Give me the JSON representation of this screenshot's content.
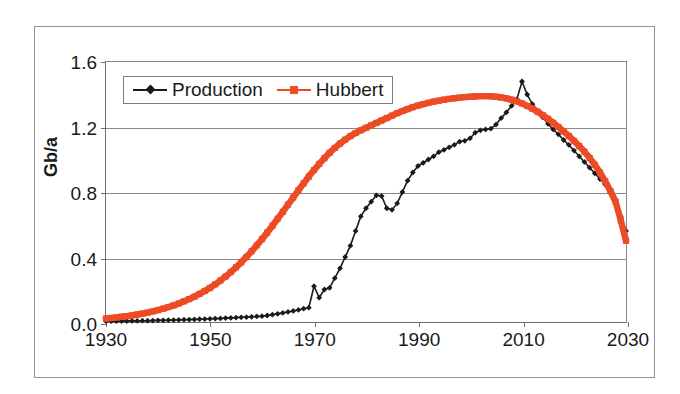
{
  "colors": {
    "production": "#1a1a1a",
    "hubbert": "#ED4A26",
    "grid": "#8a8a8a",
    "axis": "#6e6e6e",
    "frame": "#949494",
    "text": "#1a1a1a",
    "background": "#ffffff"
  },
  "axis_title_y": "Gb/a",
  "legend": {
    "items": [
      {
        "label": "Production",
        "marker": "diamond",
        "color": "#1a1a1a"
      },
      {
        "label": "Hubbert",
        "marker": "square",
        "color": "#ED4A26"
      }
    ]
  },
  "ticks": {
    "y": [
      "0.0",
      "0.4",
      "0.8",
      "1.2",
      "1.6"
    ],
    "x": [
      "1930",
      "1950",
      "1970",
      "1990",
      "2010",
      "2030"
    ]
  },
  "chart_data": {
    "type": "line",
    "title": "",
    "subtitle": "",
    "xlabel": "",
    "ylabel": "Gb/a",
    "xlim": [
      1930,
      2030
    ],
    "ylim": [
      0.0,
      1.6
    ],
    "ytick_values": [
      0.0,
      0.4,
      0.8,
      1.2,
      1.6
    ],
    "xtick_values": [
      1930,
      1950,
      1970,
      1990,
      2010,
      2030
    ],
    "grid": "horizontal",
    "legend_position": "top-left-inside",
    "x": [
      1930,
      1931,
      1932,
      1933,
      1934,
      1935,
      1936,
      1937,
      1938,
      1939,
      1940,
      1941,
      1942,
      1943,
      1944,
      1945,
      1946,
      1947,
      1948,
      1949,
      1950,
      1951,
      1952,
      1953,
      1954,
      1955,
      1956,
      1957,
      1958,
      1959,
      1960,
      1961,
      1962,
      1963,
      1964,
      1965,
      1966,
      1967,
      1968,
      1969,
      1970,
      1971,
      1972,
      1973,
      1974,
      1975,
      1976,
      1977,
      1978,
      1979,
      1980,
      1981,
      1982,
      1983,
      1984,
      1985,
      1986,
      1987,
      1988,
      1989,
      1990,
      1991,
      1992,
      1993,
      1994,
      1995,
      1996,
      1997,
      1998,
      1999,
      2000,
      2001,
      2002,
      2003,
      2004,
      2005,
      2006,
      2007,
      2008,
      2009,
      2010,
      2011,
      2012,
      2013,
      2014,
      2015,
      2016,
      2017,
      2018,
      2019,
      2020,
      2021,
      2022,
      2023,
      2024,
      2025,
      2026,
      2027,
      2028,
      2029,
      2030
    ],
    "series": [
      {
        "name": "Production",
        "color": "#1a1a1a",
        "marker": "diamond",
        "values": [
          0.005,
          0.005,
          0.005,
          0.006,
          0.006,
          0.007,
          0.007,
          0.008,
          0.008,
          0.009,
          0.01,
          0.01,
          0.011,
          0.012,
          0.013,
          0.014,
          0.015,
          0.016,
          0.017,
          0.018,
          0.02,
          0.021,
          0.022,
          0.024,
          0.025,
          0.027,
          0.029,
          0.03,
          0.032,
          0.034,
          0.036,
          0.04,
          0.045,
          0.05,
          0.056,
          0.062,
          0.068,
          0.074,
          0.082,
          0.088,
          0.22,
          0.15,
          0.2,
          0.21,
          0.27,
          0.33,
          0.4,
          0.47,
          0.56,
          0.65,
          0.7,
          0.74,
          0.78,
          0.775,
          0.7,
          0.69,
          0.73,
          0.8,
          0.87,
          0.92,
          0.96,
          0.98,
          1.0,
          1.02,
          1.045,
          1.06,
          1.075,
          1.09,
          1.11,
          1.115,
          1.13,
          1.165,
          1.18,
          1.185,
          1.19,
          1.215,
          1.255,
          1.29,
          1.33,
          1.37,
          1.48,
          1.4,
          1.34,
          1.3,
          1.26,
          1.22,
          1.185,
          1.155,
          1.12,
          1.09,
          1.055,
          1.02,
          0.985,
          0.95,
          0.915,
          0.88,
          0.845,
          0.8,
          0.74,
          0.65,
          0.56
        ]
      },
      {
        "name": "Hubbert",
        "color": "#ED4A26",
        "marker": "square",
        "values": [
          0.022,
          0.025,
          0.028,
          0.032,
          0.036,
          0.041,
          0.046,
          0.052,
          0.058,
          0.065,
          0.073,
          0.082,
          0.092,
          0.102,
          0.114,
          0.127,
          0.141,
          0.156,
          0.173,
          0.191,
          0.21,
          0.232,
          0.255,
          0.28,
          0.307,
          0.336,
          0.367,
          0.4,
          0.435,
          0.472,
          0.51,
          0.55,
          0.592,
          0.635,
          0.678,
          0.722,
          0.766,
          0.81,
          0.853,
          0.895,
          0.935,
          0.973,
          1.008,
          1.041,
          1.071,
          1.098,
          1.122,
          1.144,
          1.163,
          1.18,
          1.195,
          1.21,
          1.225,
          1.24,
          1.255,
          1.27,
          1.285,
          1.298,
          1.31,
          1.322,
          1.332,
          1.341,
          1.349,
          1.356,
          1.362,
          1.368,
          1.373,
          1.377,
          1.381,
          1.384,
          1.386,
          1.388,
          1.39,
          1.39,
          1.389,
          1.386,
          1.382,
          1.376,
          1.368,
          1.358,
          1.345,
          1.33,
          1.313,
          1.294,
          1.273,
          1.25,
          1.226,
          1.2,
          1.173,
          1.145,
          1.115,
          1.083,
          1.048,
          1.01,
          0.968,
          0.92,
          0.866,
          0.806,
          0.74,
          0.625,
          0.5
        ]
      }
    ]
  }
}
